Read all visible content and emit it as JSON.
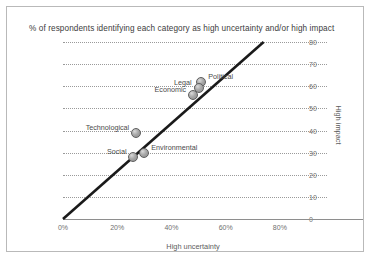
{
  "chart_data": {
    "type": "scatter",
    "title": "% of respondents identifying each category as high uncertainty and/or high impact",
    "xlabel": "High uncertainty",
    "ylabel": "High impact",
    "xlim": [
      0,
      90
    ],
    "ylim": [
      0,
      80
    ],
    "grid": true,
    "legend": "none",
    "xticks": [
      "0%",
      "20%",
      "40%",
      "60%",
      "80%"
    ],
    "xtick_values": [
      0,
      20,
      40,
      60,
      80
    ],
    "yticks": [
      "0",
      "10",
      "20",
      "30",
      "40",
      "50",
      "60",
      "70",
      "80"
    ],
    "ytick_values": [
      0,
      10,
      20,
      30,
      40,
      50,
      60,
      70,
      80
    ],
    "points": [
      {
        "label": "Political",
        "x": 51,
        "y": 62,
        "label_side": "right"
      },
      {
        "label": "Legal",
        "x": 50,
        "y": 59,
        "label_side": "left"
      },
      {
        "label": "Economic",
        "x": 48,
        "y": 56,
        "label_side": "left"
      },
      {
        "label": "Technological",
        "x": 27,
        "y": 39,
        "label_side": "left"
      },
      {
        "label": "Environmental",
        "x": 30,
        "y": 30,
        "label_side": "right"
      },
      {
        "label": "Social",
        "x": 26,
        "y": 28,
        "label_side": "left"
      }
    ],
    "trendline": {
      "x0": 0,
      "y0": 0,
      "x1": 74,
      "y1": 80
    }
  },
  "colors": {
    "marker_fill": "#a8a8a8",
    "marker_edge": "#5e5e5e",
    "trendline": "#1a1a1a",
    "gridline": "#9a9a9a",
    "axis": "#8e8e8e",
    "text": "#4a4a4a",
    "border": "#b9b9b9"
  }
}
